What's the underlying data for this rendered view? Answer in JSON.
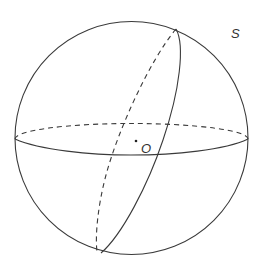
{
  "diagram": {
    "type": "sphere-with-great-circles",
    "sphere_label": "S",
    "center_label": "O",
    "colors": {
      "line": "#3a3a3a",
      "background": "#ffffff"
    },
    "elements": [
      {
        "name": "sphere-outline",
        "style": "solid"
      },
      {
        "name": "equator-front",
        "style": "solid"
      },
      {
        "name": "equator-back",
        "style": "dashed"
      },
      {
        "name": "tilted-great-circle-front",
        "style": "solid"
      },
      {
        "name": "tilted-great-circle-back",
        "style": "dashed"
      },
      {
        "name": "center-point",
        "label": "O"
      }
    ]
  }
}
